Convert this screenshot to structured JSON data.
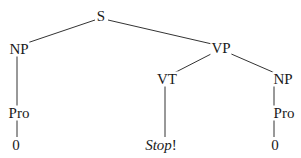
{
  "diagram": {
    "type": "syntax-tree",
    "nodes": {
      "s": {
        "label": "S"
      },
      "np_subject": {
        "label": "NP"
      },
      "vp": {
        "label": "VP"
      },
      "pro_subject": {
        "label": "Pro"
      },
      "zero_subject": {
        "label": "0"
      },
      "vt": {
        "label": "VT"
      },
      "np_object": {
        "label": "NP"
      },
      "stop": {
        "label_italic": "Stop",
        "label_punct": "!"
      },
      "pro_object": {
        "label": "Pro"
      },
      "zero_object": {
        "label": "0"
      }
    },
    "edges": [
      [
        "S",
        "NP"
      ],
      [
        "S",
        "VP"
      ],
      [
        "NP",
        "Pro"
      ],
      [
        "Pro",
        "0"
      ],
      [
        "VP",
        "VT"
      ],
      [
        "VP",
        "NP"
      ],
      [
        "VT",
        "Stop!"
      ],
      [
        "NP",
        "Pro"
      ],
      [
        "Pro",
        "0"
      ]
    ],
    "line_color": "#333333",
    "text_color": "#1a1a1a"
  }
}
